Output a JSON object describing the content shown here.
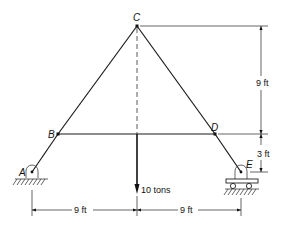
{
  "figure": {
    "type": "truss",
    "nodes": {
      "A": {
        "label": "A",
        "x": 32,
        "y": 172,
        "support": "pin"
      },
      "B": {
        "label": "B",
        "x": 58,
        "y": 134
      },
      "C": {
        "label": "C",
        "x": 137,
        "y": 26
      },
      "D": {
        "label": "D",
        "x": 215,
        "y": 134
      },
      "E": {
        "label": "E",
        "x": 241,
        "y": 172,
        "support": "roller"
      }
    },
    "members": [
      [
        "A",
        "B"
      ],
      [
        "B",
        "C"
      ],
      [
        "C",
        "D"
      ],
      [
        "D",
        "E"
      ],
      [
        "B",
        "D"
      ]
    ],
    "load": {
      "label": "10 tons",
      "at": "midpoint of BD",
      "direction": "down"
    },
    "dimensions": {
      "vertical_upper": "9 ft",
      "vertical_lower": "3 ft",
      "horizontal_left": "9 ft",
      "horizontal_right": "9 ft"
    }
  }
}
